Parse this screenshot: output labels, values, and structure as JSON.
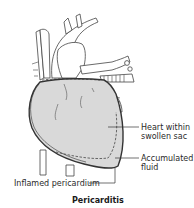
{
  "figure": {
    "caption": "Pericarditis",
    "labels": {
      "heart_sac_line1": "Heart within",
      "heart_sac_line2": "swollen sac",
      "fluid_line1": "Accumulated",
      "fluid_line2": "fluid",
      "pericardium": "Inflamed pericardium"
    },
    "colors": {
      "heart_fill": "#d9d9d9",
      "outline": "#333333",
      "leader_line": "#333333"
    }
  }
}
